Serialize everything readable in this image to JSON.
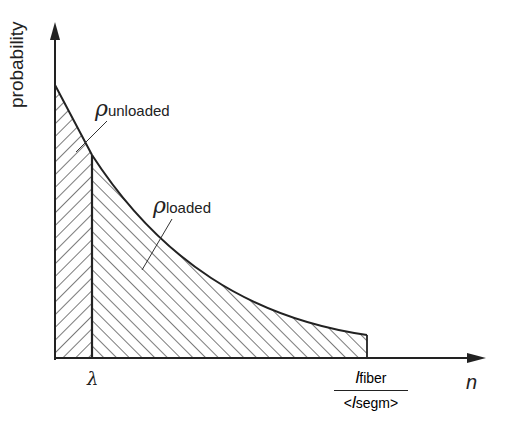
{
  "diagram": {
    "y_axis_label": "probability",
    "x_axis_label": "n",
    "lambda_label": "λ",
    "regions": [
      {
        "symbol": "ρ",
        "subscript": "unloaded",
        "hatch": "backslash",
        "x_range": "0 to λ"
      },
      {
        "symbol": "ρ",
        "subscript": "loaded",
        "hatch": "forward-slash",
        "x_range": "λ to l_fiber/<l_segm>"
      }
    ],
    "end_fraction": {
      "numerator_symbol": "l",
      "numerator_subscript": "fiber",
      "denominator_prefix": "<",
      "denominator_symbol": "l",
      "denominator_subscript": "segm",
      "denominator_suffix": ">"
    },
    "colors": {
      "line": "#222222",
      "background": "#ffffff"
    }
  }
}
